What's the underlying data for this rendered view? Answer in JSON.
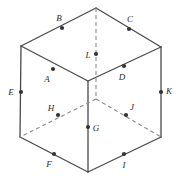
{
  "figure": {
    "name": "labelled-cube-diagram",
    "type": "line-drawing",
    "background_color": "#ffffff",
    "solid_stroke_color": "#4a4a4a",
    "hidden_stroke_color": "#8c8c8c",
    "point_color": "#333333",
    "label_color": "#2b2b2b",
    "stroke_width": 1.3,
    "hidden_stroke_width": 1.1,
    "hidden_dash_pattern": "4,3"
  },
  "vertices": {
    "top_back": {
      "name": "top-back-vertex",
      "x": 96,
      "y": 8
    },
    "top_left": {
      "name": "top-left-vertex",
      "x": 21,
      "y": 46
    },
    "top_right": {
      "name": "top-right-vertex",
      "x": 161,
      "y": 47
    },
    "top_front": {
      "name": "top-front-vertex",
      "x": 88,
      "y": 81
    },
    "bottom_left": {
      "name": "bottom-left-vertex",
      "x": 20,
      "y": 137
    },
    "bottom_right": {
      "name": "bottom-right-vertex",
      "x": 161,
      "y": 137
    },
    "bottom_front": {
      "name": "bottom-front-vertex",
      "x": 88,
      "y": 172
    },
    "bottom_back": {
      "name": "bottom-back-vertex",
      "x": 96,
      "y": 99
    }
  },
  "edges": [
    {
      "name": "edge-top-left-to-top-back",
      "from": "top_left",
      "to": "top_back",
      "hidden": false
    },
    {
      "name": "edge-top-back-to-top-right",
      "from": "top_back",
      "to": "top_right",
      "hidden": false
    },
    {
      "name": "edge-top-left-to-top-front",
      "from": "top_left",
      "to": "top_front",
      "hidden": false
    },
    {
      "name": "edge-top-front-to-top-right",
      "from": "top_front",
      "to": "top_right",
      "hidden": false
    },
    {
      "name": "edge-left-vertical",
      "from": "top_left",
      "to": "bottom_left",
      "hidden": false
    },
    {
      "name": "edge-right-vertical",
      "from": "top_right",
      "to": "bottom_right",
      "hidden": false
    },
    {
      "name": "edge-front-vertical",
      "from": "top_front",
      "to": "bottom_front",
      "hidden": false
    },
    {
      "name": "edge-bottom-left-to-bottom-front",
      "from": "bottom_left",
      "to": "bottom_front",
      "hidden": false
    },
    {
      "name": "edge-bottom-front-to-bottom-right",
      "from": "bottom_front",
      "to": "bottom_right",
      "hidden": false
    },
    {
      "name": "edge-back-vertical-hidden",
      "from": "top_back",
      "to": "bottom_back",
      "hidden": true
    },
    {
      "name": "edge-bottom-back-to-bottom-left-hidden",
      "from": "bottom_back",
      "to": "bottom_left",
      "hidden": true
    },
    {
      "name": "edge-bottom-back-to-bottom-right-hidden",
      "from": "bottom_back",
      "to": "bottom_right",
      "hidden": true
    }
  ],
  "points": [
    {
      "label": "A",
      "name": "point-a",
      "px": 53,
      "py": 69,
      "lx": 47,
      "ly": 79,
      "on": "edge-top-left-to-top-front"
    },
    {
      "label": "B",
      "name": "point-b",
      "px": 62,
      "py": 28,
      "lx": 59,
      "ly": 18,
      "on": "edge-top-left-to-top-back"
    },
    {
      "label": "C",
      "name": "point-c",
      "px": 129,
      "py": 29,
      "lx": 130,
      "ly": 19,
      "on": "edge-top-back-to-top-right"
    },
    {
      "label": "D",
      "name": "point-d",
      "px": 124,
      "py": 66,
      "lx": 122,
      "ly": 77,
      "on": "edge-top-front-to-top-right"
    },
    {
      "label": "E",
      "name": "point-e",
      "px": 21,
      "py": 92,
      "lx": 11,
      "ly": 92,
      "on": "edge-left-vertical"
    },
    {
      "label": "F",
      "name": "point-f",
      "px": 54,
      "py": 154,
      "lx": 49,
      "ly": 164,
      "on": "edge-bottom-left-to-bottom-front"
    },
    {
      "label": "G",
      "name": "point-g",
      "px": 88,
      "py": 127,
      "lx": 96,
      "ly": 128,
      "on": "edge-front-vertical"
    },
    {
      "label": "H",
      "name": "point-h",
      "px": 58,
      "py": 115,
      "lx": 51,
      "ly": 108,
      "on": "edge-bottom-back-to-bottom-left-hidden"
    },
    {
      "label": "I",
      "name": "point-i",
      "px": 124,
      "py": 154,
      "lx": 124,
      "ly": 165,
      "on": "edge-bottom-front-to-bottom-right"
    },
    {
      "label": "J",
      "name": "point-j",
      "px": 126,
      "py": 115,
      "lx": 132,
      "ly": 107,
      "on": "edge-bottom-back-to-bottom-right-hidden"
    },
    {
      "label": "K",
      "name": "point-k",
      "px": 161,
      "py": 92,
      "lx": 169,
      "ly": 91,
      "on": "edge-right-vertical"
    },
    {
      "label": "L",
      "name": "point-l",
      "px": 96,
      "py": 54,
      "lx": 88,
      "ly": 55,
      "on": "edge-back-vertical-hidden"
    }
  ]
}
